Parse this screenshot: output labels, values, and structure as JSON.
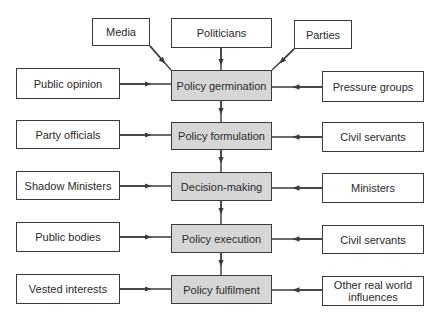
{
  "diagram": {
    "type": "flowchart",
    "stages": [
      {
        "label": "Policy germination"
      },
      {
        "label": "Policy formulation"
      },
      {
        "label": "Decision-making"
      },
      {
        "label": "Policy execution"
      },
      {
        "label": "Policy fulfilment"
      }
    ],
    "top_inputs": [
      {
        "label": "Media"
      },
      {
        "label": "Politicians"
      },
      {
        "label": "Parties"
      }
    ],
    "left_inputs": [
      {
        "label": "Public opinion"
      },
      {
        "label": "Party officials"
      },
      {
        "label": "Shadow Ministers"
      },
      {
        "label": "Public bodies"
      },
      {
        "label": "Vested interests"
      }
    ],
    "right_inputs": [
      {
        "label": "Pressure groups"
      },
      {
        "label": "Civil servants"
      },
      {
        "label": "Ministers"
      },
      {
        "label": "Civil servants"
      },
      {
        "label": "Other real world influences"
      }
    ],
    "colors": {
      "line": "#3a3a3a",
      "stage_fill": "#d6d6d6",
      "box_fill": "#ffffff"
    }
  }
}
